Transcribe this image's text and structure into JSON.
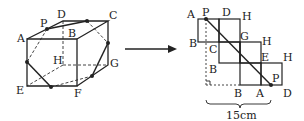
{
  "cube": {
    "labels": {
      "A": "A",
      "B": "B",
      "C": "C",
      "D": "D",
      "E": "E",
      "F": "F",
      "G": "G",
      "H": "H",
      "P": "P"
    }
  },
  "net": {
    "labels": {
      "A_top": "A",
      "P_top": "P",
      "D_top": "D",
      "H1": "H",
      "B_left": "B",
      "C": "C",
      "G": "G",
      "H2": "H",
      "B_mid": "B",
      "E": "E",
      "H3": "H",
      "P_bottom": "P",
      "B_bottom": "B",
      "A_bottom": "A",
      "D_bottom": "D"
    },
    "dimension": "15cm"
  },
  "colors": {
    "line": "#222222",
    "dashed": "#444444"
  }
}
